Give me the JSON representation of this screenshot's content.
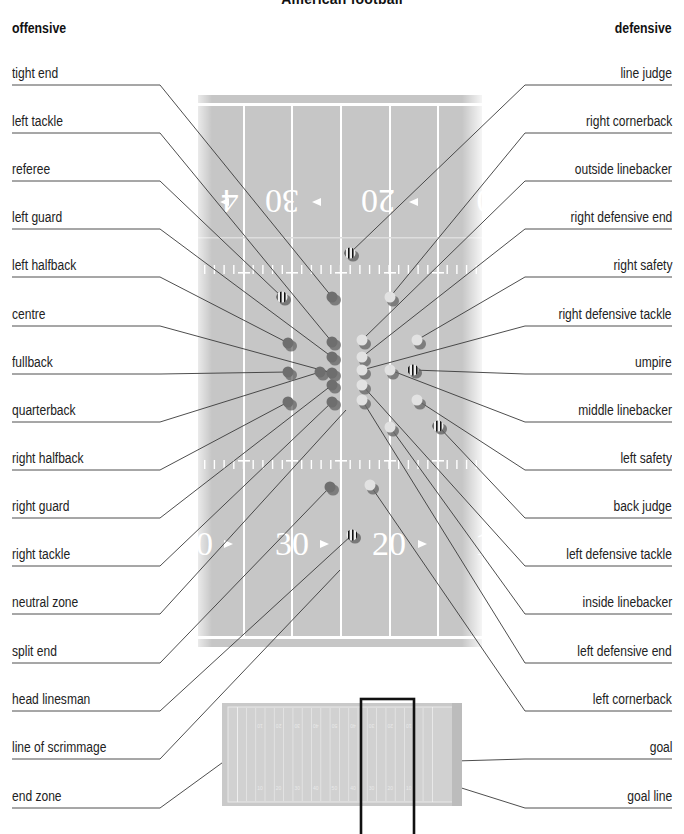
{
  "title": "American football",
  "headings": {
    "offensive": "offensive",
    "defensive": "defensive"
  },
  "left_labels": [
    {
      "text": "tight end",
      "y": 85,
      "target": [
        332,
        297
      ]
    },
    {
      "text": "left tackle",
      "y": 133,
      "target": [
        332,
        342
      ]
    },
    {
      "text": "referee",
      "y": 181,
      "target": [
        282,
        297
      ]
    },
    {
      "text": "left guard",
      "y": 229,
      "target": [
        332,
        357
      ]
    },
    {
      "text": "left halfback",
      "y": 277,
      "target": [
        288,
        343
      ]
    },
    {
      "text": "centre",
      "y": 326,
      "target": [
        332,
        373
      ]
    },
    {
      "text": "fullback",
      "y": 374,
      "target": [
        288,
        372
      ]
    },
    {
      "text": "quarterback",
      "y": 422,
      "target": [
        320,
        372
      ]
    },
    {
      "text": "right halfback",
      "y": 470,
      "target": [
        288,
        402
      ]
    },
    {
      "text": "right guard",
      "y": 518,
      "target": [
        332,
        385
      ]
    },
    {
      "text": "right tackle",
      "y": 566,
      "target": [
        332,
        402
      ]
    },
    {
      "text": "neutral zone",
      "y": 614,
      "target": [
        346,
        410
      ]
    },
    {
      "text": "split end",
      "y": 663,
      "target": [
        330,
        487
      ]
    },
    {
      "text": "head linesman",
      "y": 711,
      "target": [
        352,
        535
      ]
    },
    {
      "text": "line of scrimmage",
      "y": 759,
      "target": [
        340,
        570
      ]
    },
    {
      "text": "end zone",
      "y": 808,
      "target": [
        237,
        752
      ]
    }
  ],
  "right_labels": [
    {
      "text": "line judge",
      "y": 85,
      "target": [
        350,
        253
      ]
    },
    {
      "text": "right cornerback",
      "y": 133,
      "target": [
        390,
        297
      ]
    },
    {
      "text": "outside linebacker",
      "y": 181,
      "target": [
        362,
        340
      ]
    },
    {
      "text": "right defensive end",
      "y": 229,
      "target": [
        362,
        357
      ]
    },
    {
      "text": "right safety",
      "y": 277,
      "target": [
        417,
        340
      ]
    },
    {
      "text": "right defensive tackle",
      "y": 326,
      "target": [
        362,
        370
      ]
    },
    {
      "text": "umpire",
      "y": 374,
      "target": [
        413,
        370
      ]
    },
    {
      "text": "middle linebacker",
      "y": 422,
      "target": [
        390,
        370
      ]
    },
    {
      "text": "left safety",
      "y": 470,
      "target": [
        417,
        400
      ]
    },
    {
      "text": "back judge",
      "y": 518,
      "target": [
        438,
        426
      ]
    },
    {
      "text": "left defensive tackle",
      "y": 566,
      "target": [
        362,
        385
      ]
    },
    {
      "text": "inside linebacker",
      "y": 614,
      "target": [
        390,
        427
      ]
    },
    {
      "text": "left defensive end",
      "y": 663,
      "target": [
        362,
        400
      ]
    },
    {
      "text": "left cornerback",
      "y": 711,
      "target": [
        370,
        485
      ]
    },
    {
      "text": "goal",
      "y": 759,
      "target": [
        455,
        761
      ]
    },
    {
      "text": "goal line",
      "y": 808,
      "target": [
        452,
        785
      ]
    }
  ],
  "field": {
    "yard_numbers_top": [
      "4",
      "30",
      "20",
      "0"
    ],
    "yard_numbers_bottom": [
      "0",
      "30",
      "20",
      "1"
    ],
    "colors": {
      "turf": "#c4c4c4",
      "lines": "#ffffff",
      "offense": "#6e6e6e",
      "defense": "#e2e2e2"
    }
  },
  "players": {
    "offense": [
      [
        332,
        297
      ],
      [
        332,
        342
      ],
      [
        288,
        343
      ],
      [
        332,
        357
      ],
      [
        288,
        372
      ],
      [
        320,
        372
      ],
      [
        332,
        373
      ],
      [
        332,
        385
      ],
      [
        288,
        402
      ],
      [
        332,
        402
      ],
      [
        330,
        487
      ]
    ],
    "defense": [
      [
        390,
        297
      ],
      [
        362,
        340
      ],
      [
        417,
        340
      ],
      [
        362,
        357
      ],
      [
        362,
        370
      ],
      [
        390,
        370
      ],
      [
        362,
        385
      ],
      [
        362,
        400
      ],
      [
        417,
        400
      ],
      [
        390,
        427
      ],
      [
        370,
        485
      ]
    ],
    "officials": [
      [
        350,
        253
      ],
      [
        282,
        297
      ],
      [
        413,
        370
      ],
      [
        438,
        426
      ],
      [
        352,
        535
      ]
    ]
  },
  "mini_field": {
    "numbers_top": [
      "10",
      "20",
      "30",
      "40",
      "50",
      "40",
      "30",
      "20",
      "10"
    ],
    "numbers_bottom": [
      "10",
      "20",
      "30",
      "40",
      "50",
      "40",
      "30",
      "20",
      "10"
    ]
  }
}
